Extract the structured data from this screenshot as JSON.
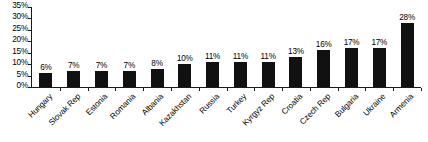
{
  "chart_data": {
    "type": "bar",
    "title": "",
    "subtitle": "",
    "xlabel": "",
    "ylabel": "",
    "ylim": [
      0,
      35
    ],
    "ytick_step": 5,
    "grid": false,
    "legend": null,
    "orientation": "vertical",
    "bar_color": "#111111",
    "background_color": "#ffffff",
    "axis_color": "#1a1a1a",
    "value_label_suffix": "%",
    "categories": [
      "Hungary",
      "Slovak Rep",
      "Estonia",
      "Romania",
      "Albania",
      "Kazakhstan",
      "Russia",
      "Turkey",
      "Kyrgyz Rep",
      "Croatia",
      "Czech Rep",
      "Bulgaria",
      "Ukraine",
      "Armenia"
    ],
    "values": [
      6,
      7,
      7,
      7,
      8,
      10,
      11,
      11,
      11,
      13,
      16,
      17,
      17,
      28
    ],
    "value_labels": [
      "6%",
      "7%",
      "7%",
      "7%",
      "8%",
      "10%",
      "11%",
      "11%",
      "11%",
      "13%",
      "16%",
      "17%",
      "17%",
      "28%"
    ],
    "ytick_labels": [
      "35%",
      "30%",
      "25%",
      "20%",
      "15%",
      "10%",
      "5%",
      "0%"
    ],
    "ytick_values": [
      35,
      30,
      25,
      20,
      15,
      10,
      5,
      0
    ]
  }
}
